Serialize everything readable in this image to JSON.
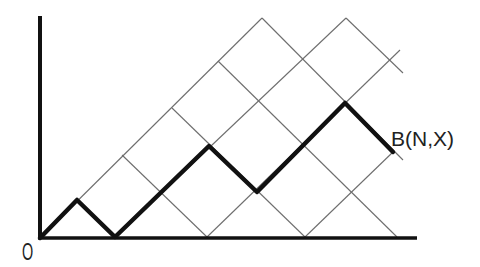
{
  "diagram": {
    "labels": {
      "origin": "O",
      "endpoint": "B(N,X)"
    },
    "label_positions": {
      "origin": {
        "x": 22,
        "y": 260,
        "font_size": 24,
        "scale_x": 0.6
      },
      "endpoint": {
        "x": 391,
        "y": 146,
        "font_size": 21,
        "scale_x": 1.0
      }
    },
    "axes": {
      "vertical": {
        "x": 40,
        "y1": 16,
        "y2": 239,
        "width": 4
      },
      "horizontal": {
        "y": 238,
        "x1": 38,
        "x2": 417,
        "width": 3.5
      }
    },
    "lattice_up_lines": [
      [
        40,
        238,
        262,
        18
      ],
      [
        115,
        237,
        346,
        18
      ],
      [
        207,
        237,
        400,
        50
      ],
      [
        305,
        237,
        393,
        152
      ]
    ],
    "lattice_down_lines": [
      [
        77,
        200,
        115,
        237
      ],
      [
        122,
        155,
        207,
        237
      ],
      [
        172,
        108,
        305,
        237
      ],
      [
        218,
        61,
        397,
        237
      ],
      [
        262,
        18,
        403,
        160
      ],
      [
        346,
        18,
        403,
        73
      ]
    ],
    "path_vertices": [
      [
        40,
        238
      ],
      [
        77,
        200
      ],
      [
        115,
        237
      ],
      [
        209,
        146
      ],
      [
        257,
        192
      ],
      [
        345,
        103
      ],
      [
        393,
        152
      ]
    ],
    "path_steps": [
      "up",
      "down",
      "up",
      "up",
      "down",
      "up",
      "up",
      "down"
    ],
    "colors": {
      "background": "#ffffff",
      "grid": "#6e6e6e",
      "path": "#111111",
      "axis": "#111111",
      "text": "#222222"
    }
  }
}
